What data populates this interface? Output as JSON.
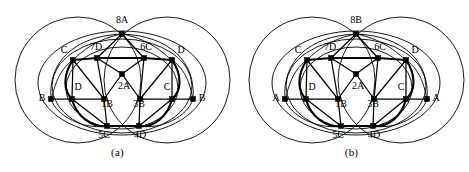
{
  "figure": {
    "type": "graph-embedding-diagram",
    "panel_count": 2,
    "background": "#ffffff",
    "ink_color": "#000000"
  },
  "panels": [
    {
      "id": "a",
      "caption": "(a)",
      "apex_label": "8A",
      "inner_labels": [
        "7D",
        "6C",
        "2A",
        "1B",
        "3B",
        "5C",
        "4D"
      ],
      "outer_labels": [
        "C",
        "D",
        "D",
        "C",
        "B",
        "B"
      ],
      "vertices": [
        {
          "name": "8A",
          "label": "8A",
          "x": 122,
          "y": 34,
          "label_x": 122,
          "label_y": 21
        },
        {
          "name": "7D",
          "label": "7D",
          "x": 97,
          "y": 58,
          "label_x": 96,
          "label_y": 48
        },
        {
          "name": "6C",
          "label": "6C",
          "x": 144,
          "y": 58,
          "label_x": 146,
          "label_y": 48
        },
        {
          "name": "2A",
          "label": "2A",
          "x": 122,
          "y": 74,
          "label_x": 124,
          "label_y": 87
        },
        {
          "name": "1B",
          "label": "1B",
          "x": 104,
          "y": 99,
          "label_x": 107,
          "label_y": 104
        },
        {
          "name": "3B",
          "label": "3B",
          "x": 140,
          "y": 99,
          "label_x": 139,
          "label_y": 104
        },
        {
          "name": "5C",
          "label": "5C",
          "x": 107,
          "y": 126,
          "label_x": 105,
          "label_y": 135
        },
        {
          "name": "4D",
          "label": "4D",
          "x": 139,
          "y": 126,
          "label_x": 141,
          "label_y": 135
        },
        {
          "name": "C-left",
          "label": "C",
          "x": 73,
          "y": 60,
          "label_x": 65,
          "label_y": 51
        },
        {
          "name": "D-right",
          "label": "D",
          "x": 172,
          "y": 60,
          "label_x": 181,
          "label_y": 51
        },
        {
          "name": "D-inner-left",
          "label": "D",
          "x": 72,
          "y": 99,
          "label_x": 77,
          "label_y": 88
        },
        {
          "name": "C-inner-right",
          "label": "C",
          "x": 172,
          "y": 99,
          "label_x": 168,
          "label_y": 88
        },
        {
          "name": "B-far-left",
          "label": "B",
          "x": 51,
          "y": 99,
          "label_x": 43,
          "label_y": 98
        },
        {
          "name": "B-far-right",
          "label": "B",
          "x": 193,
          "y": 99,
          "label_x": 201,
          "label_y": 98
        }
      ]
    },
    {
      "id": "b",
      "caption": "(b)",
      "apex_label": "8B",
      "inner_labels": [
        "7D",
        "6C",
        "2A",
        "1B",
        "3B",
        "5C",
        "4D"
      ],
      "outer_labels": [
        "C",
        "D",
        "D",
        "C",
        "A",
        "A"
      ],
      "vertices": [
        {
          "name": "8B",
          "label": "8B",
          "x": 122,
          "y": 34,
          "label_x": 122,
          "label_y": 21
        },
        {
          "name": "7D",
          "label": "7D",
          "x": 97,
          "y": 58,
          "label_x": 96,
          "label_y": 48
        },
        {
          "name": "6C",
          "label": "6C",
          "x": 144,
          "y": 58,
          "label_x": 146,
          "label_y": 48
        },
        {
          "name": "2A",
          "label": "2A",
          "x": 122,
          "y": 74,
          "label_x": 124,
          "label_y": 87
        },
        {
          "name": "1B",
          "label": "1B",
          "x": 104,
          "y": 99,
          "label_x": 107,
          "label_y": 104
        },
        {
          "name": "3B",
          "label": "3B",
          "x": 140,
          "y": 99,
          "label_x": 139,
          "label_y": 104
        },
        {
          "name": "5C",
          "label": "5C",
          "x": 107,
          "y": 126,
          "label_x": 105,
          "label_y": 135
        },
        {
          "name": "4D",
          "label": "4D",
          "x": 139,
          "y": 126,
          "label_x": 141,
          "label_y": 135
        },
        {
          "name": "C-left",
          "label": "C",
          "x": 73,
          "y": 60,
          "label_x": 65,
          "label_y": 51
        },
        {
          "name": "D-right",
          "label": "D",
          "x": 172,
          "y": 60,
          "label_x": 181,
          "label_y": 51
        },
        {
          "name": "D-inner-left",
          "label": "D",
          "x": 72,
          "y": 99,
          "label_x": 77,
          "label_y": 88
        },
        {
          "name": "C-inner-right",
          "label": "C",
          "x": 172,
          "y": 99,
          "label_x": 168,
          "label_y": 88
        },
        {
          "name": "A-far-left",
          "label": "A",
          "x": 51,
          "y": 99,
          "label_x": 43,
          "label_y": 98
        },
        {
          "name": "A-far-right",
          "label": "A",
          "x": 193,
          "y": 99,
          "label_x": 201,
          "label_y": 98
        }
      ]
    }
  ]
}
